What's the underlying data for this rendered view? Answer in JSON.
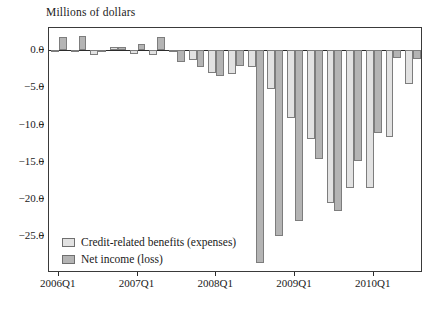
{
  "chart_data": {
    "type": "bar",
    "title": "Millions of dollars",
    "xlabel": "",
    "ylabel": "Millions of dollars",
    "ylim": [
      -30.0,
      3.0
    ],
    "yticks": [
      0.0,
      -5.0,
      -10.0,
      -15.0,
      -20.0,
      -25.0
    ],
    "ytick_labels": [
      "0.0",
      "−5.0",
      "−10.0",
      "−15.0",
      "−20.0",
      "−25.0"
    ],
    "grid": false,
    "legend_position": "inside-bottom-left",
    "categories": [
      "2006Q1",
      "2006Q2",
      "2006Q3",
      "2006Q4",
      "2007Q1",
      "2007Q2",
      "2007Q3",
      "2007Q4",
      "2008Q1",
      "2008Q2",
      "2008Q3",
      "2008Q4",
      "2009Q1",
      "2009Q2",
      "2009Q3",
      "2009Q4",
      "2010Q1",
      "2010Q2",
      "2010Q3"
    ],
    "xtick_labels": [
      "2006Q1",
      "2007Q1",
      "2008Q1",
      "2009Q1",
      "2010Q1"
    ],
    "xtick_categories": [
      "2006Q1",
      "2007Q1",
      "2008Q1",
      "2009Q1",
      "2010Q1"
    ],
    "series": [
      {
        "name": "Credit-related benefits (expenses)",
        "color": "#e2e2e2",
        "values": [
          -0.1,
          -0.2,
          -0.7,
          0.4,
          -0.5,
          -0.6,
          -0.1,
          -1.3,
          -3.1,
          -3.2,
          -2.2,
          -5.2,
          -9.1,
          -11.9,
          -20.6,
          -18.5,
          -18.6,
          -11.7,
          -4.6
        ]
      },
      {
        "name": "Net income (loss)",
        "color": "#b4b4b4",
        "values": [
          1.8,
          1.9,
          0.1,
          0.5,
          0.9,
          1.8,
          -1.6,
          -2.2,
          -3.5,
          -2.1,
          -28.6,
          -25.0,
          -23.0,
          -14.7,
          -21.6,
          -14.9,
          -11.2,
          -1.0,
          -1.2
        ]
      }
    ]
  },
  "legend": {
    "items": [
      {
        "label": "Credit-related benefits (expenses)",
        "swatch": "s0"
      },
      {
        "label": "Net income (loss)",
        "swatch": "s1"
      }
    ]
  }
}
